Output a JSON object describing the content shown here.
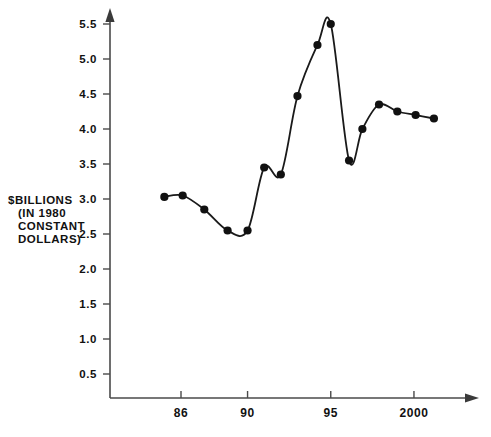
{
  "chart_data": {
    "type": "line",
    "title": "",
    "xlabel": "",
    "ylabel": "$BILLIONS (IN 1980 CONSTANT DOLLARS)",
    "ylabel_lines": [
      "$BILLIONS",
      "(IN 1980",
      "CONSTANT",
      "DOLLARS)"
    ],
    "xlim": [
      1984.3,
      2003.5
    ],
    "ylim": [
      0,
      5.75
    ],
    "grid": false,
    "legend": null,
    "marker": "filled-circle",
    "x_tick_labels": [
      "86",
      "90",
      "95",
      "2000"
    ],
    "x_tick_values": [
      1986,
      1990,
      1995,
      2000
    ],
    "y_tick_labels": [
      "0.5",
      "1.0",
      "1.5",
      "2.0",
      "2.5",
      "3.0",
      "3.5",
      "4.0",
      "4.5",
      "5.0",
      "5.5"
    ],
    "y_tick_values": [
      0.5,
      1.0,
      1.5,
      2.0,
      2.5,
      3.0,
      3.5,
      4.0,
      4.5,
      5.0,
      5.5
    ],
    "x": [
      1985.0,
      1986.1,
      1987.4,
      1988.8,
      1990.0,
      1991.0,
      1992.0,
      1993.0,
      1994.2,
      1995.0,
      1996.1,
      1996.9,
      1997.9,
      1999.0,
      2000.1,
      2001.2
    ],
    "y": [
      3.03,
      3.05,
      2.85,
      2.55,
      2.55,
      3.45,
      3.35,
      4.47,
      5.2,
      5.5,
      3.55,
      4.0,
      4.35,
      4.25,
      4.2,
      4.15
    ],
    "series": [
      {
        "name": "spending",
        "values": [
          3.03,
          3.05,
          2.85,
          2.55,
          2.55,
          3.45,
          3.35,
          4.47,
          5.2,
          5.5,
          3.55,
          4.0,
          4.35,
          4.25,
          4.2,
          4.15
        ]
      }
    ],
    "axis_style": {
      "x_axis_arrow": true,
      "y_axis_arrow": true,
      "line_color": "#4a4a4a",
      "curve_color": "#1a1a1a"
    }
  }
}
